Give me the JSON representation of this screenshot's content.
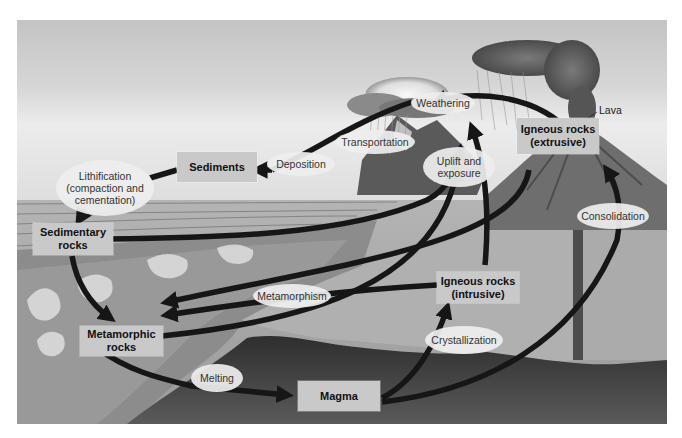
{
  "diagram": {
    "colors": {
      "background": "#ffffff",
      "sky_top": "#cfcfcf",
      "sky_band": "#e6e6e6",
      "ground": "#a6a6a6",
      "magma": "#3a3a3a",
      "arrow": "#161616",
      "box_fill": "#c9c9c9",
      "oval_fill": "#eeeeee"
    },
    "boxes": {
      "sediments": "Sediments",
      "igneous_extrusive_line1": "Igneous rocks",
      "igneous_extrusive_line2": "(extrusive)",
      "sedimentary_line1": "Sedimentary",
      "sedimentary_line2": "rocks",
      "igneous_intrusive_line1": "Igneous rocks",
      "igneous_intrusive_line2": "(intrusive)",
      "metamorphic_line1": "Metamorphic",
      "metamorphic_line2": "rocks",
      "magma": "Magma"
    },
    "processes": {
      "weathering": "Weathering",
      "transportation": "Transportation",
      "deposition": "Deposition",
      "lithification_line1": "Lithification",
      "lithification_line2": "(compaction and",
      "lithification_line3": "cementation)",
      "uplift_line1": "Uplift and",
      "uplift_line2": "exposure",
      "consolidation": "Consolidation",
      "metamorphism": "Metamorphism",
      "crystallization": "Crystallization",
      "melting": "Melting"
    },
    "annotations": {
      "lava": "Lava"
    }
  }
}
